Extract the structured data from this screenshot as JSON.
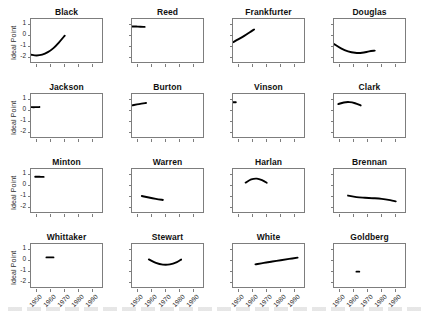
{
  "figure": {
    "ylabel": "Ideal Point",
    "rows": 4,
    "cols": 4
  },
  "axes": {
    "y_ticks": [
      "1",
      "0",
      "-1",
      "-2"
    ],
    "y_values": [
      1,
      0,
      -1,
      -2
    ],
    "x_ticks": [
      "1950",
      "1960",
      "1970",
      "1980",
      "1990"
    ],
    "x_values": [
      1950,
      1960,
      1970,
      1980,
      1990
    ]
  },
  "chart_data": {
    "type": "line",
    "title": "",
    "subtitle": "",
    "xlabel": "",
    "ylabel": "Ideal Point",
    "xlim": [
      1946,
      1998
    ],
    "ylim": [
      -2.6,
      1.5
    ],
    "grid": false,
    "legend": "none",
    "layout": "small-multiples 4x4",
    "x_tick_labels": [
      "1950",
      "1960",
      "1970",
      "1980",
      "1990"
    ],
    "y_tick_labels": [
      "1",
      "0",
      "-1",
      "-2"
    ],
    "panels": [
      {
        "name": "Black",
        "row": 0,
        "col": 0,
        "x": [
          1946,
          1950,
          1954,
          1958,
          1962,
          1966,
          1970
        ],
        "y": [
          -1.75,
          -1.82,
          -1.75,
          -1.52,
          -1.15,
          -0.62,
          -0.02
        ]
      },
      {
        "name": "Reed",
        "row": 0,
        "col": 1,
        "x": [
          1946,
          1949,
          1952,
          1955
        ],
        "y": [
          0.82,
          0.81,
          0.8,
          0.78
        ]
      },
      {
        "name": "Frankfurter",
        "row": 0,
        "col": 2,
        "x": [
          1946,
          1950,
          1954,
          1958,
          1961
        ],
        "y": [
          -0.62,
          -0.34,
          -0.04,
          0.29,
          0.55
        ]
      },
      {
        "name": "Douglas",
        "row": 0,
        "col": 3,
        "x": [
          1946,
          1951,
          1956,
          1961,
          1966,
          1971,
          1975
        ],
        "y": [
          -0.78,
          -1.18,
          -1.45,
          -1.58,
          -1.58,
          -1.45,
          -1.38
        ]
      },
      {
        "name": "Jackson",
        "row": 1,
        "col": 0,
        "x": [
          1946,
          1949,
          1952
        ],
        "y": [
          0.3,
          0.3,
          0.31
        ]
      },
      {
        "name": "Burton",
        "row": 1,
        "col": 1,
        "x": [
          1946,
          1951,
          1956
        ],
        "y": [
          0.46,
          0.58,
          0.68
        ]
      },
      {
        "name": "Vinson",
        "row": 1,
        "col": 2,
        "x": [
          1946,
          1948
        ],
        "y": [
          0.75,
          0.75
        ]
      },
      {
        "name": "Clark",
        "row": 1,
        "col": 3,
        "x": [
          1949,
          1953,
          1957,
          1961,
          1965
        ],
        "y": [
          0.58,
          0.73,
          0.76,
          0.66,
          0.46
        ]
      },
      {
        "name": "Minton",
        "row": 2,
        "col": 0,
        "x": [
          1949,
          1952,
          1955
        ],
        "y": [
          0.8,
          0.79,
          0.78
        ]
      },
      {
        "name": "Warren",
        "row": 2,
        "col": 1,
        "x": [
          1953,
          1958,
          1963,
          1968
        ],
        "y": [
          -0.96,
          -1.1,
          -1.22,
          -1.32
        ]
      },
      {
        "name": "Harlan",
        "row": 2,
        "col": 2,
        "x": [
          1955,
          1959,
          1963,
          1967,
          1970
        ],
        "y": [
          0.26,
          0.55,
          0.62,
          0.46,
          0.25
        ]
      },
      {
        "name": "Brennan",
        "row": 2,
        "col": 3,
        "x": [
          1956,
          1962,
          1968,
          1974,
          1980,
          1986,
          1990
        ],
        "y": [
          -0.92,
          -1.06,
          -1.12,
          -1.16,
          -1.22,
          -1.34,
          -1.45
        ]
      },
      {
        "name": "Whittaker",
        "row": 3,
        "col": 0,
        "x": [
          1957,
          1960,
          1962
        ],
        "y": [
          0.28,
          0.28,
          0.28
        ]
      },
      {
        "name": "Stewart",
        "row": 3,
        "col": 1,
        "x": [
          1958,
          1963,
          1968,
          1973,
          1978,
          1981
        ],
        "y": [
          0.1,
          -0.22,
          -0.38,
          -0.36,
          -0.15,
          0.08
        ]
      },
      {
        "name": "White",
        "row": 3,
        "col": 2,
        "x": [
          1962,
          1968,
          1974,
          1980,
          1986,
          1992
        ],
        "y": [
          -0.36,
          -0.22,
          -0.1,
          0.02,
          0.14,
          0.26
        ]
      },
      {
        "name": "Goldberg",
        "row": 3,
        "col": 3,
        "x": [
          1962,
          1964
        ],
        "y": [
          -1.02,
          -1.02
        ]
      }
    ]
  }
}
